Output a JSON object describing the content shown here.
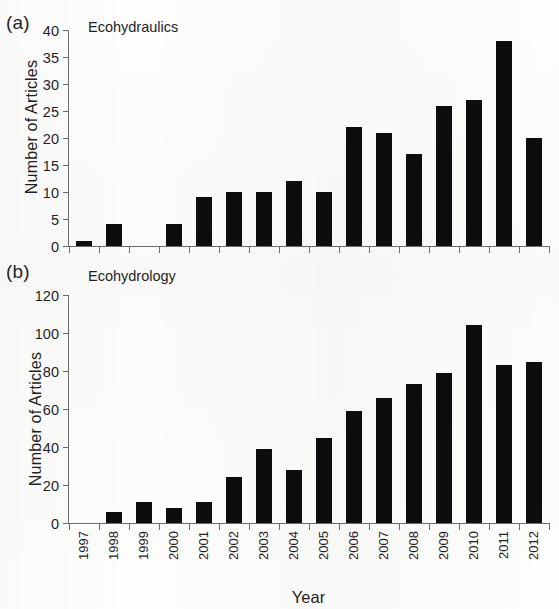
{
  "figure": {
    "background_color": "#fdfdfc",
    "bar_color": "#0d0d0d",
    "axis_color": "#6e6e6e",
    "xlabel": "Year"
  },
  "panels": [
    {
      "letter": "(a)",
      "title": "Ecohydraulics",
      "ylabel": "Number of Articles",
      "yticks": [
        "0",
        "5",
        "10",
        "15",
        "20",
        "25",
        "30",
        "35",
        "40"
      ],
      "ylim": [
        0,
        40
      ]
    },
    {
      "letter": "(b)",
      "title": "Ecohydrology",
      "ylabel": "Number of Articles",
      "yticks": [
        "0",
        "20",
        "40",
        "60",
        "80",
        "100",
        "120"
      ],
      "ylim": [
        0,
        120
      ]
    }
  ],
  "chart_data": [
    {
      "type": "bar",
      "title": "Ecohydraulics",
      "panel": "(a)",
      "xlabel": "Year",
      "ylabel": "Number of Articles",
      "ylim": [
        0,
        40
      ],
      "ytick_interval": 5,
      "grid": false,
      "legend": null,
      "categories": [
        "1997",
        "1998",
        "1999",
        "2000",
        "2001",
        "2002",
        "2003",
        "2004",
        "2005",
        "2006",
        "2007",
        "2008",
        "2009",
        "2010",
        "2011",
        "2012"
      ],
      "values": [
        1,
        4,
        0,
        4,
        9,
        10,
        10,
        12,
        10,
        22,
        21,
        17,
        26,
        27,
        38,
        20
      ]
    },
    {
      "type": "bar",
      "title": "Ecohydrology",
      "panel": "(b)",
      "xlabel": "Year",
      "ylabel": "Number of Articles",
      "ylim": [
        0,
        120
      ],
      "ytick_interval": 20,
      "grid": false,
      "legend": null,
      "categories": [
        "1997",
        "1998",
        "1999",
        "2000",
        "2001",
        "2002",
        "2003",
        "2004",
        "2005",
        "2006",
        "2007",
        "2008",
        "2009",
        "2010",
        "2011",
        "2012"
      ],
      "values": [
        0,
        6,
        11,
        8,
        11,
        24,
        39,
        28,
        45,
        59,
        66,
        73,
        79,
        104,
        83,
        85
      ]
    }
  ]
}
